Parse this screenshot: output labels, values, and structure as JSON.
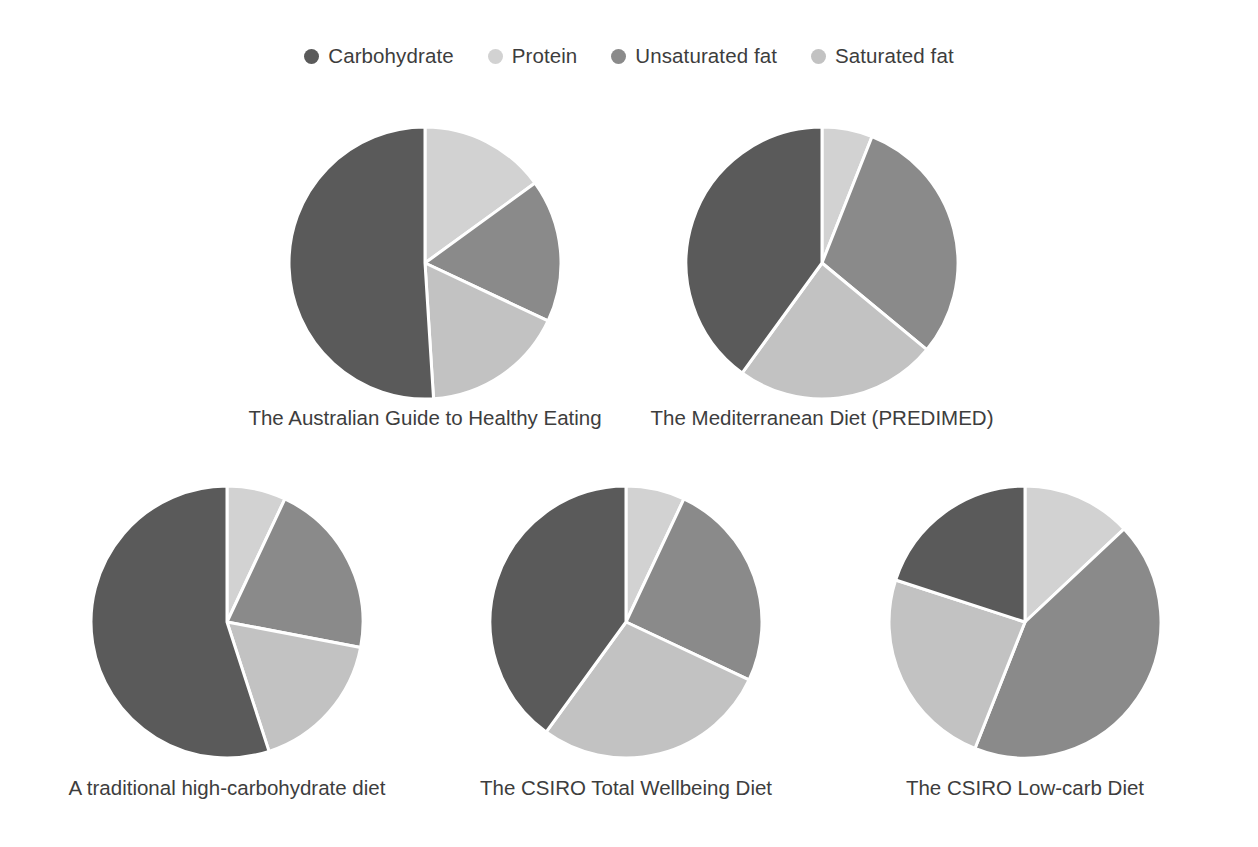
{
  "legend": {
    "items": [
      {
        "label": "Carbohydrate",
        "key": "carbohydrate",
        "color": "#5a5a5a"
      },
      {
        "label": "Protein",
        "key": "protein",
        "color": "#d2d2d2"
      },
      {
        "label": "Unsaturated fat",
        "key": "unsaturated_fat",
        "color": "#8a8a8a"
      },
      {
        "label": "Saturated fat",
        "key": "saturated_fat",
        "color": "#c2c2c2"
      }
    ]
  },
  "chart_data": {
    "type": "pie",
    "title": "",
    "legend_position": "top-center",
    "legend_entries": [
      "Carbohydrate",
      "Protein",
      "Unsaturated fat",
      "Saturated fat"
    ],
    "categories": [
      "Carbohydrate",
      "Protein",
      "Unsaturated fat",
      "Saturated fat"
    ],
    "colors": [
      "#5a5a5a",
      "#d2d2d2",
      "#8a8a8a",
      "#c2c2c2"
    ],
    "value_unit": "percent of energy",
    "charts": [
      {
        "label": "The Australian Guide to Healthy Eating",
        "values": [
          51,
          15,
          17,
          17
        ],
        "row": 1,
        "col": 1
      },
      {
        "label": "The Mediterranean Diet (PREDIMED)",
        "values": [
          40,
          6,
          30,
          24
        ],
        "row": 1,
        "col": 2
      },
      {
        "label": "A traditional high-carbohydrate diet",
        "values": [
          55,
          7,
          21,
          17
        ],
        "row": 2,
        "col": 1
      },
      {
        "label": "The CSIRO Total Wellbeing Diet",
        "values": [
          40,
          7,
          25,
          28
        ],
        "row": 2,
        "col": 2
      },
      {
        "label": "The CSIRO Low-carb Diet",
        "values": [
          20,
          13,
          43,
          24
        ],
        "row": 2,
        "col": 3
      }
    ]
  }
}
